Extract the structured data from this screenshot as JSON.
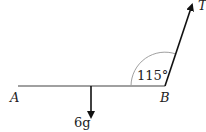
{
  "diagram": {
    "type": "mechanics-free-body",
    "rod": {
      "start_label": "A",
      "end_label": "B",
      "color": "#a0a0a0"
    },
    "forces": [
      {
        "name": "weight",
        "label": "6g",
        "direction": "down"
      },
      {
        "name": "tension",
        "label": "T",
        "direction": "up-right",
        "angle_to_rod": "115°"
      }
    ],
    "angle_label": "115°",
    "arc_color": "#a0a0a0",
    "force_color": "#111111"
  }
}
